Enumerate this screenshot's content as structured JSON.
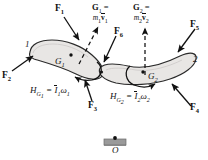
{
  "figure": {
    "kind": "free-body / momentum diagram of two-link mechanism",
    "bodies": [
      {
        "number": "1",
        "cg_label": "G",
        "cg_sub": "1"
      },
      {
        "number": "2",
        "cg_label": "G",
        "cg_sub": "2"
      }
    ],
    "support": {
      "label": "O",
      "name": "pin-support-O"
    }
  },
  "forces": [
    {
      "id": "F1",
      "base": "F",
      "sub": "1"
    },
    {
      "id": "F2",
      "base": "F",
      "sub": "2"
    },
    {
      "id": "F3",
      "base": "F",
      "sub": "3"
    },
    {
      "id": "F4",
      "base": "F",
      "sub": "4"
    },
    {
      "id": "F5",
      "base": "F",
      "sub": "5"
    },
    {
      "id": "F6",
      "base": "F",
      "sub": "6"
    }
  ],
  "momentum": {
    "linear_1": {
      "lhs": "G",
      "lhs_sub": "1",
      "eq": "=",
      "mass": "m",
      "mass_sub": "1",
      "vel": "v",
      "vel_sub": "1"
    },
    "linear_2": {
      "lhs": "G",
      "lhs_sub": "2",
      "eq": "=",
      "mass": "m",
      "mass_sub": "2",
      "vel": "v",
      "vel_sub": "2"
    },
    "angular_1": {
      "lhs": "H",
      "lhs_sub": "G",
      "lhs_sub2": "1",
      "eq": "=",
      "inertia": "I",
      "inertia_sub": "1",
      "omega": "ω",
      "omega_sub": "1"
    },
    "angular_2": {
      "lhs": "H",
      "lhs_sub": "G",
      "lhs_sub2": "2",
      "eq": "=",
      "inertia": "I",
      "inertia_sub": "2",
      "omega": "ω",
      "omega_sub": "2"
    }
  },
  "colors": {
    "stroke": "#111111",
    "body_fill": "#e8e6e4",
    "body_stroke": "#2a2a2a",
    "support_fill": "#8f8f8f",
    "background": "#ffffff"
  }
}
